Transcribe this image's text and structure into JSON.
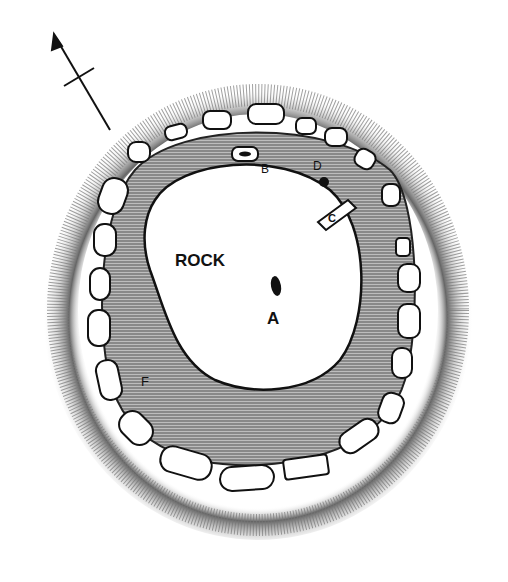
{
  "diagram": {
    "type": "archaeological site plan (stone circle / cairn enclosure)",
    "north_arrow": true,
    "labels": {
      "rock": "ROCK",
      "a": "A",
      "b": "B",
      "c": "C",
      "d": "D",
      "f": "F"
    },
    "features": [
      {
        "id": "rock",
        "label": "ROCK",
        "description": "large central outcrop (unshaded)"
      },
      {
        "id": "A",
        "label": "A",
        "description": "dark pit/hole on rock"
      },
      {
        "id": "B",
        "label": "B",
        "description": "small rectangular stone with dark center"
      },
      {
        "id": "C",
        "label": "C",
        "description": "slanted stone slab"
      },
      {
        "id": "D",
        "label": "D",
        "description": "small dark post-hole"
      },
      {
        "id": "F",
        "label": "F",
        "description": "shaded floor area"
      }
    ],
    "colors": {
      "ink": "#111111",
      "shade": "#8a8a8a",
      "paper": "#ffffff"
    }
  }
}
